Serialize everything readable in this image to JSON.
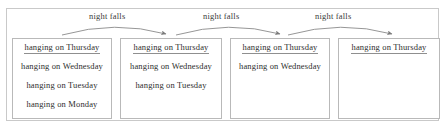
{
  "diagram": {
    "colors": {
      "outer_frame": "#c9c9c9",
      "box_border": "#b9b9b9",
      "text": "#2e2e2e",
      "arrow": "#808080",
      "underline": "#8f8f8f",
      "background": "#ffffff"
    },
    "boxes": [
      {
        "id": "box-0",
        "lines": [
          "hanging on Thursday",
          "hanging  on Wednesday",
          "hanging  on Tuesday",
          "hanging  on Monday"
        ]
      },
      {
        "id": "box-1",
        "lines": [
          "hanging  on Thursday",
          "hanging on Wednesday",
          "hanging  on Tuesday"
        ]
      },
      {
        "id": "box-2",
        "lines": [
          "hanging on Thursday",
          "hanging  on Wednesday"
        ]
      },
      {
        "id": "box-3",
        "lines": [
          "hanging  on Thursday"
        ]
      }
    ],
    "arrows": [
      {
        "id": "arrow-0",
        "label": "night falls",
        "from": "box-0",
        "to": "box-1"
      },
      {
        "id": "arrow-1",
        "label": "night falls",
        "from": "box-1",
        "to": "box-2"
      },
      {
        "id": "arrow-2",
        "label": "night falls",
        "from": "box-2",
        "to": "box-3"
      }
    ]
  }
}
